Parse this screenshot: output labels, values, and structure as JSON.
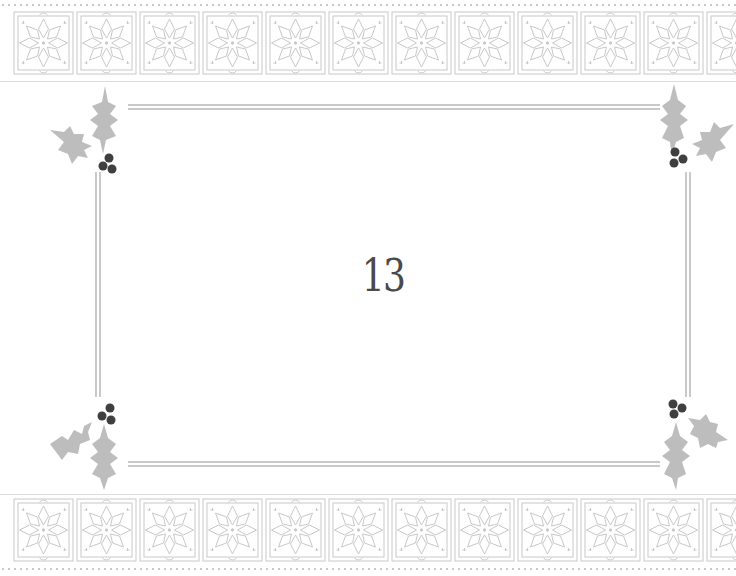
{
  "card": {
    "number": "13",
    "colors": {
      "background": "#ffffff",
      "pattern": "#c8c8c8",
      "frame": "#c9c9c9",
      "holly_leaf": "#bdbdbd",
      "holly_berry": "#3f3f3f",
      "number": "#4a4a4a"
    },
    "decorations": {
      "top_band": "snowflake-pattern",
      "bottom_band": "snowflake-pattern",
      "corners": [
        "holly",
        "holly",
        "holly",
        "holly"
      ]
    }
  }
}
